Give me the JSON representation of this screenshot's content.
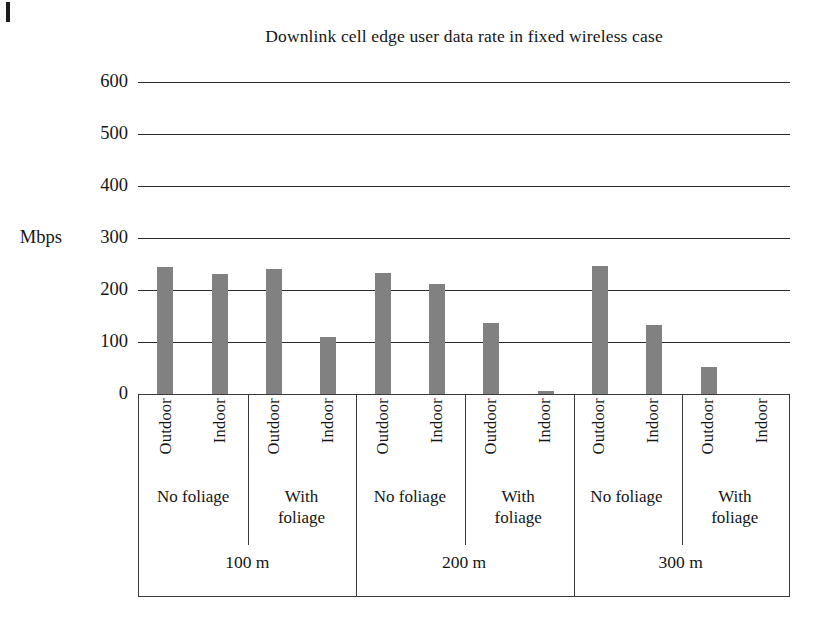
{
  "chart_data": {
    "type": "bar",
    "title": "Downlink cell edge user data rate in fixed wireless case",
    "xlabel": "",
    "ylabel": "Mbps",
    "ylim": [
      0,
      600
    ],
    "yticks": [
      0,
      100,
      200,
      300,
      400,
      500,
      600
    ],
    "grid": true,
    "legend": "none",
    "bar_color": "#818181",
    "categories": [
      "100 m / No foliage / Outdoor",
      "100 m / No foliage / Indoor",
      "100 m / With foliage / Outdoor",
      "100 m / With foliage / Indoor",
      "200 m / No foliage / Outdoor",
      "200 m / No foliage / Indoor",
      "200 m / With foliage / Outdoor",
      "200 m / With foliage / Indoor",
      "300 m / No foliage / Outdoor",
      "300 m / No foliage / Indoor",
      "300 m / With foliage / Outdoor",
      "300 m / With foliage / Indoor"
    ],
    "values": [
      245,
      231,
      241,
      110,
      232,
      211,
      137,
      6,
      247,
      133,
      51,
      0
    ],
    "groups": [
      {
        "distance": "100 m",
        "foliage": [
          {
            "label": "No foliage",
            "bars": [
              {
                "label": "Outdoor",
                "value": 245
              },
              {
                "label": "Indoor",
                "value": 231
              }
            ]
          },
          {
            "label": "With foliage",
            "bars": [
              {
                "label": "Outdoor",
                "value": 241
              },
              {
                "label": "Indoor",
                "value": 110
              }
            ]
          }
        ]
      },
      {
        "distance": "200 m",
        "foliage": [
          {
            "label": "No foliage",
            "bars": [
              {
                "label": "Outdoor",
                "value": 232
              },
              {
                "label": "Indoor",
                "value": 211
              }
            ]
          },
          {
            "label": "With foliage",
            "bars": [
              {
                "label": "Outdoor",
                "value": 137
              },
              {
                "label": "Indoor",
                "value": 6
              }
            ]
          }
        ]
      },
      {
        "distance": "300 m",
        "foliage": [
          {
            "label": "No foliage",
            "bars": [
              {
                "label": "Outdoor",
                "value": 247
              },
              {
                "label": "Indoor",
                "value": 133
              }
            ]
          },
          {
            "label": "With foliage",
            "bars": [
              {
                "label": "Outdoor",
                "value": 51
              },
              {
                "label": "Indoor",
                "value": 0
              }
            ]
          }
        ]
      }
    ]
  },
  "axis": {
    "unit_label": "Mbps",
    "ticks": [
      "600",
      "500",
      "400",
      "300",
      "200",
      "100",
      "0"
    ]
  },
  "title": "Downlink cell edge user data rate in fixed wireless case"
}
